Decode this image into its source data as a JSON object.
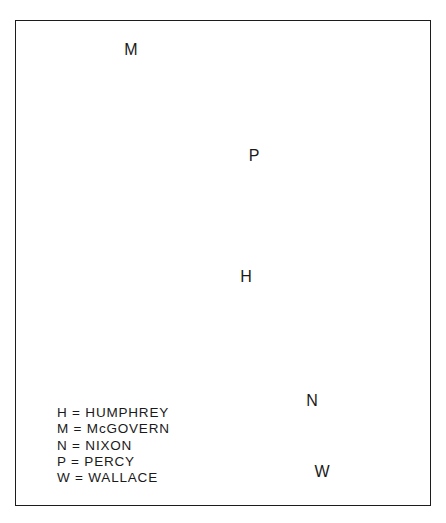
{
  "diagram": {
    "type": "spatial-map",
    "points": [
      {
        "label": "M",
        "name": "McGOVERN",
        "x": 131,
        "y": 50
      },
      {
        "label": "P",
        "name": "PERCY",
        "x": 254,
        "y": 156
      },
      {
        "label": "H",
        "name": "HUMPHREY",
        "x": 246,
        "y": 277
      },
      {
        "label": "N",
        "name": "NIXON",
        "x": 312,
        "y": 401
      },
      {
        "label": "W",
        "name": "WALLACE",
        "x": 322,
        "y": 472
      }
    ],
    "legend": [
      {
        "text": "H = HUMPHREY"
      },
      {
        "text": "M = McGOVERN"
      },
      {
        "text": "N = NIXON"
      },
      {
        "text": "P = PERCY"
      },
      {
        "text": "W = WALLACE"
      }
    ]
  }
}
